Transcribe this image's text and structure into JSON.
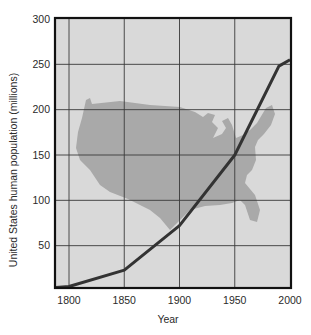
{
  "chart_data": {
    "type": "line",
    "title": "",
    "xlabel": "Year",
    "ylabel": "United States human population (millions)",
    "xlim": [
      1787,
      2002
    ],
    "ylim": [
      0,
      300
    ],
    "x_ticks": [
      1800,
      1850,
      1900,
      1950,
      2000
    ],
    "y_ticks": [
      50,
      100,
      150,
      200,
      250,
      300
    ],
    "x_tick_labels": [
      "1800",
      "1850",
      "1900",
      "1950",
      "2000"
    ],
    "y_tick_labels": [
      "50",
      "100",
      "150",
      "200",
      "250",
      "300"
    ],
    "grid": true,
    "background_image": "united-states-map-silhouette",
    "series": [
      {
        "name": "US population",
        "x": [
          1787,
          1800,
          1850,
          1900,
          1950,
          1990,
          2000
        ],
        "values": [
          4,
          5,
          23,
          72,
          150,
          248,
          255
        ]
      }
    ],
    "colors": {
      "plot_background": "#d9d9d9",
      "map_fill": "#a9a9a9",
      "grid_line": "#3a3a3a",
      "frame": "#111111",
      "line": "#333333"
    }
  }
}
